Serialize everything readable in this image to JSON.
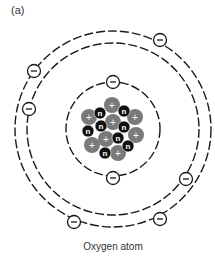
{
  "panel_label": "(a)",
  "caption": "Oxygen atom",
  "atom": {
    "element": "Oxygen",
    "center": [
      113,
      129
    ],
    "shells": [
      {
        "name": "inner-shell",
        "radius": 47,
        "electrons": 2
      },
      {
        "name": "outer-shell-inner-path",
        "radius": 86
      },
      {
        "name": "outer-shell-outer-path",
        "radius": 98
      },
      {
        "name": "outer-shell",
        "electrons": 6
      }
    ],
    "electron_symbol": "−",
    "proton_symbol": "+",
    "neutron_symbol": "n",
    "protons": 8,
    "neutrons": 8
  },
  "colors": {
    "line": "#1a1a1a",
    "proton": "#7a7a7a",
    "neutron": "#111111",
    "electron_fill": "#ffffff"
  },
  "electrons": [
    {
      "x": 113,
      "y": 82
    },
    {
      "x": 113,
      "y": 178
    },
    {
      "x": 160,
      "y": 40
    },
    {
      "x": 34,
      "y": 71
    },
    {
      "x": 29,
      "y": 109
    },
    {
      "x": 186,
      "y": 179
    },
    {
      "x": 74,
      "y": 222
    },
    {
      "x": 160,
      "y": 219
    }
  ],
  "protons": [
    {
      "x": 112,
      "y": 105
    },
    {
      "x": 89,
      "y": 117
    },
    {
      "x": 113,
      "y": 122
    },
    {
      "x": 135,
      "y": 117
    },
    {
      "x": 106,
      "y": 139
    },
    {
      "x": 136,
      "y": 135
    },
    {
      "x": 92,
      "y": 145
    },
    {
      "x": 118,
      "y": 153
    }
  ],
  "neutrons": [
    {
      "x": 100,
      "y": 113
    },
    {
      "x": 124,
      "y": 111
    },
    {
      "x": 101,
      "y": 126
    },
    {
      "x": 124,
      "y": 127
    },
    {
      "x": 88,
      "y": 131
    },
    {
      "x": 118,
      "y": 138
    },
    {
      "x": 128,
      "y": 146
    },
    {
      "x": 105,
      "y": 153
    }
  ]
}
